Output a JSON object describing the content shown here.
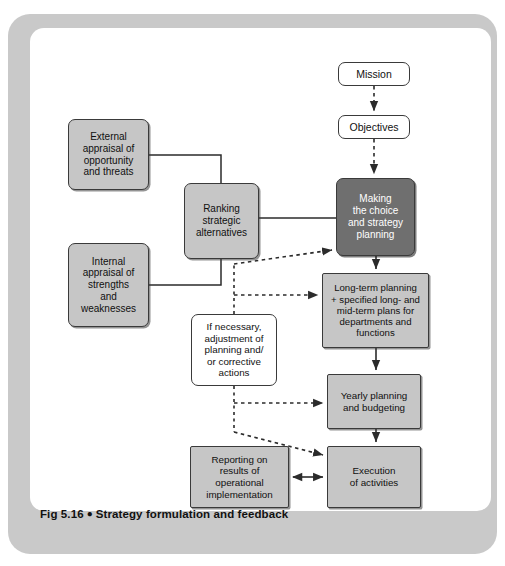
{
  "figure": {
    "caption_number": "Fig 5.16",
    "caption_bullet": "●",
    "caption_title": "Strategy formulation and feedback",
    "frame_color": "#c9c9c9",
    "panel_color": "#ffffff"
  },
  "palette": {
    "box_light_fill": "#c6c6c6",
    "box_dark_fill": "#6f6f6f",
    "box_white_fill": "#ffffff",
    "box_border": "#3a3a3a",
    "connector_color": "#2b2b2b",
    "dark_box_text": "#ffffff",
    "light_box_text": "#101010"
  },
  "diagram": {
    "type": "flowchart",
    "nodes": [
      {
        "id": "mission",
        "label": "Mission",
        "style": "white",
        "x": 338,
        "y": 62,
        "w": 72,
        "h": 24
      },
      {
        "id": "objectives",
        "label": "Objectives",
        "style": "white",
        "x": 338,
        "y": 115,
        "w": 72,
        "h": 24
      },
      {
        "id": "external-appraisal",
        "label": "External\nappraisal of\nopportunity\nand threats",
        "style": "light",
        "x": 68,
        "y": 119,
        "w": 81,
        "h": 71
      },
      {
        "id": "internal-appraisal",
        "label": "Internal\nappraisal of\nstrengths\nand\nweaknesses",
        "style": "light",
        "x": 68,
        "y": 243,
        "w": 81,
        "h": 84
      },
      {
        "id": "ranking-alternatives",
        "label": "Ranking\nstrategic\nalternatives",
        "style": "light",
        "x": 184,
        "y": 183,
        "w": 75,
        "h": 76
      },
      {
        "id": "making-choice",
        "label": "Making\nthe choice\nand strategy\nplanning",
        "style": "dark",
        "x": 336,
        "y": 178,
        "w": 79,
        "h": 78
      },
      {
        "id": "long-term-planning",
        "label": "Long-term planning\n+ specified long- and\nmid-term plans for\ndepartments and\nfunctions",
        "style": "light",
        "x": 322,
        "y": 273,
        "w": 107,
        "h": 75
      },
      {
        "id": "if-necessary-adjustment",
        "label": "If necessary,\nadjustment of\nplanning and/\nor corrective\nactions",
        "style": "white",
        "x": 191,
        "y": 314,
        "w": 86,
        "h": 72
      },
      {
        "id": "yearly-planning",
        "label": "Yearly planning\nand budgeting",
        "style": "light",
        "x": 327,
        "y": 374,
        "w": 94,
        "h": 55
      },
      {
        "id": "reporting",
        "label": "Reporting on\nresults of\noperational\nimplementation",
        "style": "light",
        "x": 190,
        "y": 446,
        "w": 99,
        "h": 62
      },
      {
        "id": "execution",
        "label": "Execution\nof activities",
        "style": "light",
        "x": 327,
        "y": 446,
        "w": 94,
        "h": 62
      }
    ],
    "edges": [
      {
        "id": "mission-to-objectives",
        "from": "mission",
        "to": "objectives",
        "style": "dashed",
        "arrow": "end"
      },
      {
        "id": "objectives-to-making-choice",
        "from": "objectives",
        "to": "making-choice",
        "style": "dashed",
        "arrow": "end"
      },
      {
        "id": "external-to-ranking",
        "from": "external-appraisal",
        "to": "ranking-alternatives",
        "style": "solid",
        "arrow": "none"
      },
      {
        "id": "internal-to-ranking",
        "from": "internal-appraisal",
        "to": "ranking-alternatives",
        "style": "solid",
        "arrow": "none"
      },
      {
        "id": "ranking-to-making-choice",
        "from": "ranking-alternatives",
        "to": "making-choice",
        "style": "solid",
        "arrow": "none"
      },
      {
        "id": "making-choice-to-long-term",
        "from": "making-choice",
        "to": "long-term-planning",
        "style": "solid",
        "arrow": "end"
      },
      {
        "id": "long-term-to-yearly",
        "from": "long-term-planning",
        "to": "yearly-planning",
        "style": "solid",
        "arrow": "end"
      },
      {
        "id": "yearly-to-execution",
        "from": "yearly-planning",
        "to": "execution",
        "style": "solid",
        "arrow": "end"
      },
      {
        "id": "reporting-execution-bidirectional",
        "from": "reporting",
        "to": "execution",
        "style": "solid",
        "arrow": "both"
      },
      {
        "id": "adjustment-to-making-choice",
        "from": "if-necessary-adjustment",
        "to": "making-choice",
        "style": "dashed",
        "arrow": "end"
      },
      {
        "id": "adjustment-to-long-term",
        "from": "if-necessary-adjustment",
        "to": "long-term-planning",
        "style": "dashed",
        "arrow": "end"
      },
      {
        "id": "adjustment-to-yearly",
        "from": "if-necessary-adjustment",
        "to": "yearly-planning",
        "style": "dashed",
        "arrow": "end"
      },
      {
        "id": "adjustment-to-execution",
        "from": "if-necessary-adjustment",
        "to": "execution",
        "style": "dashed",
        "arrow": "end"
      }
    ]
  }
}
